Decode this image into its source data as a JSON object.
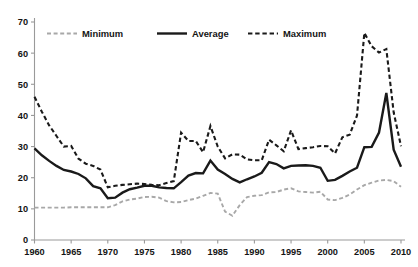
{
  "chart_data": {
    "type": "line",
    "title": "",
    "subtitle": "",
    "xlabel": "",
    "ylabel": "",
    "xlim": [
      1960,
      2010
    ],
    "ylim": [
      0,
      70
    ],
    "ytick_step": 10,
    "xtick_step": 5,
    "grid": false,
    "legend_position": "top-inside",
    "x": [
      1960,
      1961,
      1962,
      1963,
      1964,
      1965,
      1966,
      1967,
      1968,
      1969,
      1970,
      1971,
      1972,
      1973,
      1974,
      1975,
      1976,
      1977,
      1978,
      1979,
      1980,
      1981,
      1982,
      1983,
      1984,
      1985,
      1986,
      1987,
      1988,
      1989,
      1990,
      1991,
      1992,
      1993,
      1994,
      1995,
      1996,
      1997,
      1998,
      1999,
      2000,
      2001,
      2002,
      2003,
      2004,
      2005,
      2006,
      2007,
      2008,
      2009,
      2010
    ],
    "xtick_labels": [
      "1960",
      "1965",
      "1970",
      "1975",
      "1980",
      "1985",
      "1990",
      "1995",
      "2000",
      "2005",
      "2010"
    ],
    "ytick_labels": [
      "0",
      "10",
      "20",
      "30",
      "40",
      "50",
      "60",
      "70"
    ],
    "series": [
      {
        "name": "Minimum",
        "style": "dashed",
        "color": "#a8a8a8",
        "width": 1.9,
        "values": [
          10.4,
          10.4,
          10.4,
          10.4,
          10.4,
          10.5,
          10.5,
          10.5,
          10.5,
          10.5,
          10.5,
          11.2,
          12.4,
          13.0,
          13.3,
          13.8,
          13.9,
          13.6,
          12.5,
          12.1,
          12.2,
          12.8,
          13.3,
          14.2,
          15.1,
          14.9,
          9.1,
          7.8,
          11.2,
          13.8,
          14.2,
          14.4,
          15.3,
          15.4,
          16.2,
          16.6,
          15.6,
          15.4,
          15.2,
          15.5,
          13.0,
          12.8,
          13.5,
          14.6,
          16.2,
          17.6,
          18.4,
          19.1,
          19.3,
          18.9,
          17.1
        ]
      },
      {
        "name": "Average",
        "style": "solid",
        "color": "#1a1a1a",
        "width": 2.4,
        "values": [
          29.4,
          27.2,
          25.4,
          23.8,
          22.5,
          22.0,
          21.2,
          19.8,
          17.3,
          16.6,
          13.4,
          13.6,
          15.2,
          16.3,
          16.8,
          17.4,
          17.4,
          16.9,
          16.7,
          16.6,
          18.6,
          20.7,
          21.5,
          21.4,
          25.5,
          22.6,
          21.2,
          19.6,
          18.5,
          19.5,
          20.4,
          21.6,
          25.0,
          24.4,
          23.0,
          23.8,
          23.9,
          24.0,
          23.8,
          23.2,
          19.0,
          19.3,
          20.6,
          22.0,
          23.2,
          29.8,
          29.9,
          34.5,
          47.2,
          29.0,
          23.5
        ]
      },
      {
        "name": "Maximum",
        "style": "dashed",
        "color": "#1a1a1a",
        "width": 2.1,
        "values": [
          46.0,
          41.2,
          36.8,
          33.4,
          30.0,
          30.2,
          26.1,
          24.5,
          23.8,
          22.6,
          16.9,
          17.4,
          17.7,
          17.9,
          18.1,
          18.0,
          17.7,
          17.6,
          18.3,
          18.9,
          34.5,
          31.8,
          31.8,
          28.2,
          36.6,
          30.0,
          26.2,
          27.5,
          27.4,
          25.9,
          25.6,
          25.6,
          32.2,
          30.4,
          28.5,
          35.2,
          29.2,
          29.5,
          29.8,
          30.2,
          30.1,
          27.8,
          33.0,
          33.8,
          40.0,
          66.5,
          62.2,
          60.2,
          61.3,
          41.0,
          30.1
        ]
      }
    ]
  }
}
